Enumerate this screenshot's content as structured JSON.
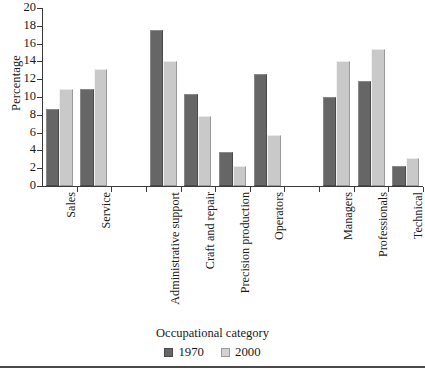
{
  "chart_data": {
    "type": "bar",
    "title": "",
    "xlabel": "Occupational category",
    "ylabel": "Percentage",
    "ylim": [
      0,
      20
    ],
    "yticks": [
      0,
      2,
      4,
      6,
      8,
      10,
      12,
      14,
      16,
      18,
      20
    ],
    "grid": false,
    "legend_position": "bottom",
    "categories": [
      "Sales",
      "Service",
      "Administrative support",
      "Craft and repair",
      "Precision production",
      "Operators",
      "Managers",
      "Professionals",
      "Technical"
    ],
    "series": [
      {
        "name": "1970",
        "color": "#666666",
        "values": [
          8.6,
          10.9,
          17.5,
          10.3,
          3.8,
          12.6,
          10.0,
          11.8,
          2.3
        ]
      },
      {
        "name": "2000",
        "color": "#c9c9c9",
        "values": [
          10.9,
          13.2,
          14.1,
          7.9,
          2.3,
          5.7,
          14.1,
          15.4,
          3.2
        ]
      }
    ],
    "group_breaks_after": [
      "Service",
      "Operators"
    ]
  },
  "axis": {
    "y_tick_labels": [
      "0",
      "2",
      "4",
      "6",
      "8",
      "10",
      "12",
      "14",
      "16",
      "18",
      "20"
    ],
    "y_title": "Percentage",
    "x_title": "Occupational category"
  },
  "legend": {
    "items": [
      {
        "label": "1970",
        "swatch": "dark-gray-square"
      },
      {
        "label": "2000",
        "swatch": "light-gray-square"
      }
    ]
  }
}
